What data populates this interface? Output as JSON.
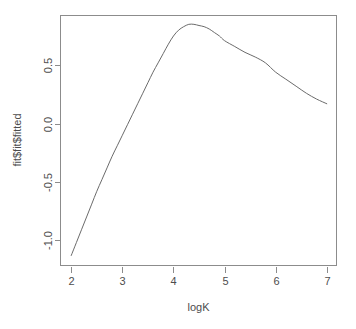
{
  "chart_data": {
    "type": "line",
    "title": "",
    "xlabel": "logK",
    "ylabel": "fit$fit$fitted",
    "xlim": [
      1.78,
      7.2
    ],
    "ylim": [
      -1.22,
      0.93
    ],
    "xticks": [
      "2",
      "3",
      "4",
      "5",
      "6",
      "7"
    ],
    "xtick_values": [
      2,
      3,
      4,
      5,
      6,
      7
    ],
    "yticks": [
      "0.5",
      "0.0",
      "-0.5",
      "-1.0"
    ],
    "ytick_values": [
      0.5,
      0.0,
      -0.5,
      -1.0
    ],
    "grid": false,
    "legend": false,
    "series": [
      {
        "name": "fitted",
        "x": [
          2.0,
          2.1,
          2.2,
          2.3,
          2.4,
          2.5,
          2.6,
          2.7,
          2.8,
          2.9,
          3.0,
          3.1,
          3.2,
          3.3,
          3.4,
          3.5,
          3.6,
          3.7,
          3.8,
          3.9,
          4.0,
          4.1,
          4.2,
          4.3,
          4.4,
          4.5,
          4.6,
          4.7,
          4.8,
          4.9,
          5.0,
          5.2,
          5.4,
          5.6,
          5.8,
          6.0,
          6.2,
          6.4,
          6.6,
          6.8,
          7.0
        ],
        "values": [
          -1.13,
          -1.02,
          -0.91,
          -0.8,
          -0.69,
          -0.58,
          -0.48,
          -0.38,
          -0.28,
          -0.19,
          -0.1,
          -0.01,
          0.08,
          0.17,
          0.26,
          0.35,
          0.44,
          0.52,
          0.6,
          0.68,
          0.75,
          0.8,
          0.83,
          0.85,
          0.85,
          0.84,
          0.83,
          0.81,
          0.78,
          0.75,
          0.71,
          0.66,
          0.61,
          0.57,
          0.52,
          0.44,
          0.38,
          0.32,
          0.26,
          0.21,
          0.17
        ]
      }
    ],
    "peak": {
      "x": 4.3,
      "y": 0.85
    },
    "endpoints": {
      "left": {
        "x": 2.0,
        "y": -1.13
      },
      "right": {
        "x": 7.0,
        "y": 0.17
      }
    },
    "colors": {
      "background": "#ffffff",
      "curve": "#6b6b6b",
      "axis": "#8c8c8c",
      "text": "#4d4d4d"
    }
  },
  "plot_geometry": {
    "box_left": 60,
    "box_right": 337,
    "box_top": 15,
    "box_bottom": 266
  }
}
